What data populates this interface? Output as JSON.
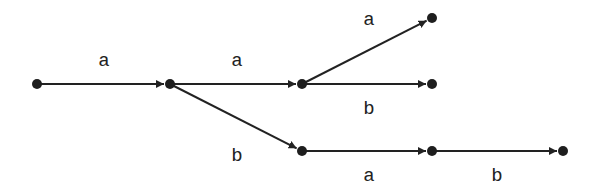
{
  "diagram": {
    "type": "tree-automaton",
    "nodes": [
      {
        "id": "n0",
        "x": 37,
        "y": 84
      },
      {
        "id": "n1",
        "x": 170,
        "y": 84
      },
      {
        "id": "n2",
        "x": 302,
        "y": 84
      },
      {
        "id": "n3",
        "x": 432,
        "y": 18
      },
      {
        "id": "n4",
        "x": 432,
        "y": 84
      },
      {
        "id": "n5",
        "x": 302,
        "y": 151
      },
      {
        "id": "n6",
        "x": 432,
        "y": 151
      },
      {
        "id": "n7",
        "x": 563,
        "y": 151
      }
    ],
    "edges": [
      {
        "from": "n0",
        "to": "n1",
        "label": "a",
        "lx": 104,
        "ly": 66
      },
      {
        "from": "n1",
        "to": "n2",
        "label": "a",
        "lx": 237,
        "ly": 66
      },
      {
        "from": "n1",
        "to": "n5",
        "label": "b",
        "lx": 237,
        "ly": 161
      },
      {
        "from": "n2",
        "to": "n3",
        "label": "a",
        "lx": 369,
        "ly": 25
      },
      {
        "from": "n2",
        "to": "n4",
        "label": "b",
        "lx": 369,
        "ly": 114
      },
      {
        "from": "n5",
        "to": "n6",
        "label": "a",
        "lx": 369,
        "ly": 181
      },
      {
        "from": "n6",
        "to": "n7",
        "label": "b",
        "lx": 497,
        "ly": 181
      }
    ]
  }
}
